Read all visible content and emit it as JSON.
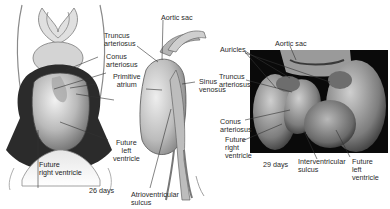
{
  "figure": {
    "panels": [
      {
        "id": "ventral-drawing",
        "labels": {
          "truncus": "Truncus\narteriosus",
          "conus": "Conus\narteriosus",
          "primitive_atrium": "Primitive\natrium",
          "future_left_ventricle": "Future\nleft\nventricle",
          "future_right_ventricle": "Future\nright ventricle"
        }
      },
      {
        "id": "lateral-drawing",
        "caption": "26 days",
        "labels": {
          "aortic_sac": "Aortic sac",
          "sinus_venosus": "Sinus\nvenosus",
          "atrioventricular_sulcus": "Atrioventricular\nsulcus"
        }
      },
      {
        "id": "sem-micrograph",
        "caption": "29 days",
        "labels": {
          "aortic_sac": "Aortic sac",
          "auricles": "Auricles",
          "truncus": "Truncus\narteriosus",
          "conus": "Conus\narteriosus",
          "future_right_ventricle": "Future\nright\nventricle",
          "interventricular_sulcus": "Interventricular\nsulcus",
          "future_left_ventricle": "Future\nleft ventricle"
        }
      }
    ],
    "colors": {
      "background": "#ffffff",
      "label_text": "#2a2a2a",
      "leader_line": "#333333",
      "drawing_dark": "#2b2b2b",
      "drawing_mid": "#9a9a9a",
      "drawing_light": "#dcdcdc",
      "sem_background": "#0a0a0a"
    }
  }
}
